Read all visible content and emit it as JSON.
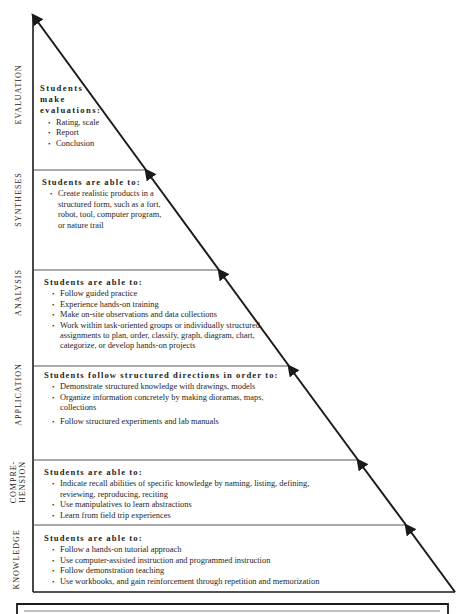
{
  "diagram": {
    "levels": [
      {
        "name": "EVALUATION",
        "heading": "Students make evaluations:",
        "heading_lines": [
          "Students",
          "make",
          "evaluations:"
        ],
        "items": [
          "Rating, scale",
          "Report",
          "Conclusion"
        ]
      },
      {
        "name": "SYNTHESES",
        "heading": "Students are able to:",
        "items": [
          "Create realistic products in a structured form, such as a fort, robot, tool, computer program, or nature trail"
        ]
      },
      {
        "name": "ANALYSIS",
        "heading": "Students are able to:",
        "items": [
          "Follow guided practice",
          "Experience hands-on training",
          "Make on-site observations and data collections",
          "Work within task-oriented groups or individually structured assignments to plan, order, classify, graph, diagram, chart, categorize, or develop hands-on projects"
        ]
      },
      {
        "name": "APPLICATION",
        "heading": "Students follow structured directions in order to:",
        "items": [
          "Demonstrate structured knowledge with drawings, models",
          "Organize information concretely by making dioramas, maps, collections",
          "Follow structured experiments and lab manuals"
        ]
      },
      {
        "name": "COMPRE-HENSION",
        "name_lines": [
          "COMPRE-",
          "HENSION"
        ],
        "heading": "Students are able to:",
        "items": [
          "Indicate recall abilities of specific knowledge by naming, listing, defining, reviewing, reproducing, reciting",
          "Use manipulatives to learn abstractions",
          "Learn from field trip experiences"
        ]
      },
      {
        "name": "KNOWLEDGE",
        "heading": "Students are able to:",
        "items": [
          "Follow a hands-on tutorial approach",
          "Use computer-assisted instruction and programmed instruction",
          "Follow demonstration teaching",
          "Use workbooks, and gain reinforcement through repetition and memorization"
        ]
      }
    ],
    "colors": {
      "line": "#1a1a1a",
      "divider": "#555555",
      "background": "#ffffff"
    }
  }
}
